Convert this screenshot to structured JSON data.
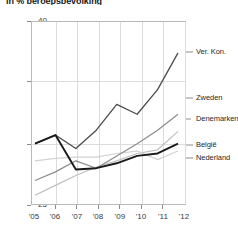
{
  "chart_data": {
    "type": "line",
    "title": "in % beroepsbevolking",
    "xlabel": "",
    "ylabel": "",
    "x": [
      "'05",
      "'06",
      "'07",
      "'08",
      "'09",
      "'10",
      "'11",
      "'12"
    ],
    "xlim": [
      2005,
      2012
    ],
    "ylim": [
      25,
      40
    ],
    "yticks": [
      25,
      30,
      35,
      40
    ],
    "grid": true,
    "legend_position": "right-inline",
    "series": [
      {
        "name": "Ver. Kon.",
        "values": [
          30.0,
          30.7,
          29.6,
          31.1,
          33.2,
          32.4,
          34.4,
          37.4
        ]
      },
      {
        "name": "Zweden",
        "values": [
          27.0,
          27.7,
          28.6,
          28.0,
          29.0,
          30.0,
          31.1,
          32.4
        ]
      },
      {
        "name": "Denemarken",
        "values": [
          25.8,
          26.6,
          27.4,
          28.1,
          28.6,
          29.2,
          29.5,
          31.0
        ]
      },
      {
        "name": "België",
        "values": [
          30.0,
          30.7,
          27.9,
          28.0,
          28.4,
          29.0,
          29.2,
          30.0
        ]
      },
      {
        "name": "Nederland",
        "values": [
          28.6,
          28.8,
          28.9,
          28.9,
          29.2,
          29.4,
          28.7,
          29.4
        ]
      }
    ]
  },
  "axis": {
    "y_labels": [
      "40",
      "35",
      "30",
      "25"
    ],
    "x_labels": [
      "'05",
      "'06",
      "'07",
      "'08",
      "'09",
      "'10",
      "'11",
      "'12"
    ]
  },
  "series_labels": {
    "ver_kon": "Ver. Kon.",
    "zweden": "Zweden",
    "denemarken": "Denemarken",
    "belgie": "België",
    "nederland": "Nederland"
  },
  "colors": {
    "ver_kon": "#4c4c4c",
    "zweden": "#8c8c8c",
    "denemarken": "#bfbfbf",
    "belgie": "#1a1a1a",
    "nederland": "#d2d2d2",
    "grid": "#dcdcdc",
    "frame": "#b9b9b9",
    "text": "#3a3a3a"
  }
}
